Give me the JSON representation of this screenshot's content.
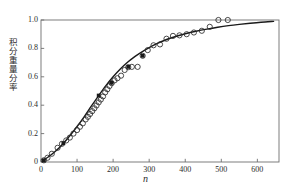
{
  "chart_data": {
    "type": "scatter",
    "title": "",
    "subtitle": "",
    "xlabel": "n",
    "ylabel": "积分重量分率",
    "xlim": [
      0,
      660
    ],
    "ylim": [
      0,
      1.0
    ],
    "xticks": [
      0,
      100,
      200,
      300,
      400,
      500,
      600
    ],
    "xticklabels": [
      "0",
      "100",
      "200",
      "300",
      "400",
      "500",
      "600"
    ],
    "yticks": [
      0,
      0.2,
      0.4,
      0.6,
      0.8,
      1.0
    ],
    "yticklabels": [
      "0",
      "0.2",
      "0.4",
      "0.6",
      "0.8",
      "1.0"
    ],
    "grid": false,
    "legend": false,
    "legend_position": "none",
    "series": [
      {
        "name": "model-curve",
        "type": "line",
        "marker": "none",
        "color": "#1a1a1a",
        "linewidth": 1.4,
        "x": [
          5,
          20,
          40,
          60,
          80,
          100,
          120,
          140,
          160,
          180,
          200,
          220,
          240,
          260,
          280,
          300,
          320,
          340,
          360,
          380,
          400,
          430,
          460,
          490,
          520,
          550,
          580,
          610,
          645
        ],
        "y": [
          0.012,
          0.035,
          0.075,
          0.125,
          0.185,
          0.25,
          0.32,
          0.395,
          0.468,
          0.538,
          0.6,
          0.655,
          0.702,
          0.742,
          0.776,
          0.806,
          0.832,
          0.854,
          0.873,
          0.889,
          0.903,
          0.921,
          0.936,
          0.949,
          0.96,
          0.969,
          0.977,
          0.984,
          0.99
        ]
      },
      {
        "name": "experimental-open-circles",
        "type": "scatter",
        "marker": "o",
        "marker_fill": "none",
        "color": "#2b2b2b",
        "markersize": 3.4,
        "x": [
          8,
          18,
          30,
          46,
          58,
          70,
          80,
          90,
          100,
          108,
          116,
          124,
          130,
          136,
          142,
          148,
          154,
          160,
          166,
          172,
          178,
          184,
          190,
          196,
          204,
          212,
          222,
          232,
          242,
          252,
          268,
          282,
          296,
          312,
          330,
          348,
          366,
          384,
          404,
          424,
          446,
          468,
          492,
          518
        ],
        "y": [
          0.012,
          0.03,
          0.058,
          0.1,
          0.128,
          0.152,
          0.172,
          0.2,
          0.225,
          0.248,
          0.272,
          0.3,
          0.318,
          0.338,
          0.358,
          0.378,
          0.398,
          0.42,
          0.44,
          0.462,
          0.49,
          0.512,
          0.535,
          0.555,
          0.575,
          0.59,
          0.608,
          0.648,
          0.668,
          0.67,
          0.67,
          0.748,
          0.788,
          0.822,
          0.828,
          0.868,
          0.888,
          0.892,
          0.9,
          0.912,
          0.924,
          0.952,
          1.0,
          1.0
        ]
      },
      {
        "name": "experimental-filled-squares",
        "type": "scatter",
        "marker": "s",
        "marker_fill": "#1a1a1a",
        "color": "#1a1a1a",
        "markersize": 3.0,
        "x": [
          8,
          62,
          160,
          196,
          242,
          282
        ],
        "y": [
          0.012,
          0.132,
          0.468,
          0.558,
          0.67,
          0.748
        ]
      }
    ]
  },
  "axes": {
    "frame_color": "#6f6f6f",
    "tick_color": "#6f6f6f"
  }
}
